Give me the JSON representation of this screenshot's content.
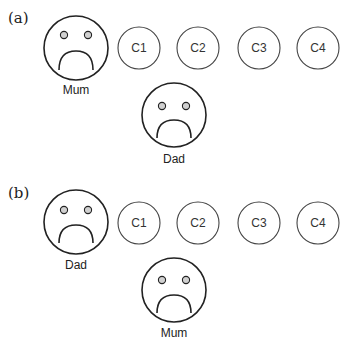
{
  "panels": [
    {
      "label": "(a)",
      "top_face": {
        "label": "Mum",
        "expression": "sad"
      },
      "children": [
        "C1",
        "C2",
        "C3",
        "C4"
      ],
      "bottom_face": {
        "label": "Dad",
        "expression": "sad"
      }
    },
    {
      "label": "(b)",
      "top_face": {
        "label": "Dad",
        "expression": "sad"
      },
      "children": [
        "C1",
        "C2",
        "C3",
        "C4"
      ],
      "bottom_face": {
        "label": "Mum",
        "expression": "sad"
      }
    }
  ],
  "colors": {
    "stroke_face": "#222222",
    "stroke_child": "#444444",
    "eye_fill": "#d0d0d0"
  }
}
